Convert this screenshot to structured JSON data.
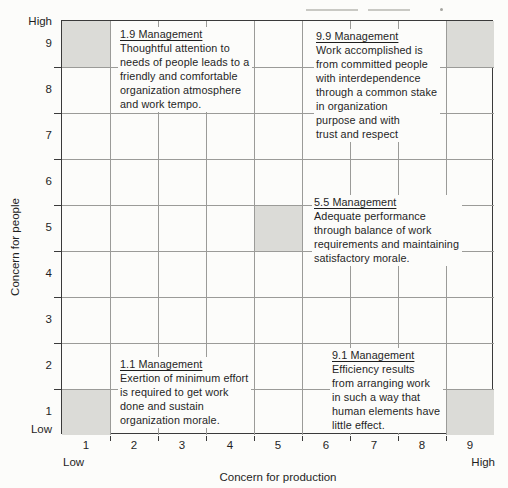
{
  "figure": {
    "y_axis": {
      "title": "Concern for people",
      "high_label": "High",
      "low_label": "Low",
      "ticks": [
        "9",
        "8",
        "7",
        "6",
        "5",
        "4",
        "3",
        "2",
        "1"
      ]
    },
    "x_axis": {
      "title": "Concern for production",
      "low_label": "Low",
      "high_label": "High",
      "ticks": [
        "1",
        "2",
        "3",
        "4",
        "5",
        "6",
        "7",
        "8",
        "9"
      ]
    },
    "blocks": [
      {
        "id": "1-9",
        "title": "1.9 Management",
        "lines": [
          "Thoughtful attention to",
          "needs of people leads to a",
          "friendly and comfortable",
          "organization atmosphere",
          "and work tempo."
        ]
      },
      {
        "id": "9-9",
        "title": "9.9 Management",
        "lines": [
          "Work accomplished is",
          "from committed people",
          "with interdependence",
          "through a common stake",
          "in organization",
          "purpose and with",
          "trust and respect"
        ]
      },
      {
        "id": "5-5",
        "title": "5.5 Management",
        "lines": [
          "Adequate performance",
          "through balance of work",
          "requirements and maintaining",
          "satisfactory morale."
        ]
      },
      {
        "id": "1-1",
        "title": "1.1 Management",
        "lines": [
          "Exertion of minimum effort",
          "is required to get work",
          "done and sustain",
          "organization morale."
        ]
      },
      {
        "id": "9-1",
        "title": "9.1 Management",
        "lines": [
          "Efficiency results",
          "from arranging work",
          "in such a way that",
          "human elements have",
          "little effect."
        ]
      }
    ],
    "colors": {
      "background": "#fcfcfa",
      "text": "#1f1f1f",
      "grid_line": "#9b9b98",
      "border": "#3a3a3a",
      "shaded_cell": "#dbdbd7"
    }
  },
  "chart_data": {
    "type": "grid-diagram",
    "xlabel": "Concern for production",
    "ylabel": "Concern for people",
    "xlim": [
      1,
      9
    ],
    "ylim": [
      1,
      9
    ],
    "x_ticks": [
      1,
      2,
      3,
      4,
      5,
      6,
      7,
      8,
      9
    ],
    "y_ticks": [
      1,
      2,
      3,
      4,
      5,
      6,
      7,
      8,
      9
    ],
    "grid": true,
    "shaded_points": [
      {
        "production": 1,
        "people": 9,
        "label": "1.9 Management"
      },
      {
        "production": 9,
        "people": 9,
        "label": "9.9 Management"
      },
      {
        "production": 5,
        "people": 5,
        "label": "5.5 Management"
      },
      {
        "production": 1,
        "people": 1,
        "label": "1.1 Management"
      },
      {
        "production": 9,
        "people": 1,
        "label": "9.1 Management"
      }
    ]
  }
}
